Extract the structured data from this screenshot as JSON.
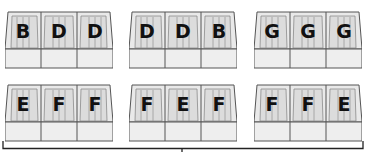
{
  "colors": {
    "tile_top": "#e9e9e9",
    "tile_panel": "#dcdcdc",
    "tile_base": "#eeeeee",
    "stroke": "#555555",
    "letter": "#111111"
  },
  "rows": [
    {
      "groups": [
        {
          "tiles": [
            "B",
            "D",
            "D"
          ]
        },
        {
          "tiles": [
            "D",
            "D",
            "B"
          ]
        },
        {
          "tiles": [
            "G",
            "G",
            "G"
          ]
        }
      ]
    },
    {
      "groups": [
        {
          "tiles": [
            "E",
            "F",
            "F"
          ]
        },
        {
          "tiles": [
            "F",
            "E",
            "F"
          ]
        },
        {
          "tiles": [
            "F",
            "F",
            "E"
          ]
        }
      ]
    }
  ],
  "bracket": {
    "under_row": 2,
    "has_center_tick": true
  }
}
